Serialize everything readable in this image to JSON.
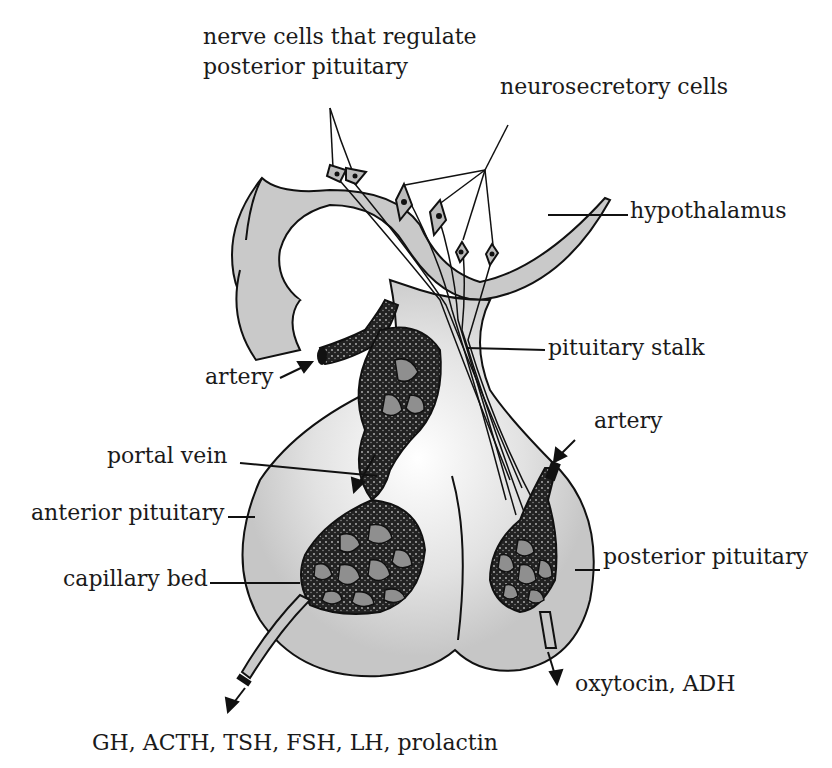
{
  "diagram": {
    "colors": {
      "tissue": "#c9c9c9",
      "tissue_light": "#ececec",
      "vessel": "#1c1c1c",
      "capillary_space": "#8f8f8f",
      "outline": "#111111",
      "text": "#1a1a1a"
    },
    "labels": {
      "nerve_cells_line1": "nerve cells that regulate",
      "nerve_cells_line2": "posterior pituitary",
      "neurosecretory_cells": "neurosecretory cells",
      "hypothalamus": "hypothalamus",
      "artery_left": "artery",
      "pituitary_stalk": "pituitary stalk",
      "artery_right": "artery",
      "portal_vein": "portal vein",
      "anterior_pituitary": "anterior pituitary",
      "capillary_bed": "capillary bed",
      "posterior_pituitary": "posterior pituitary",
      "posterior_output": "oxytocin, ADH",
      "anterior_output": "GH, ACTH, TSH, FSH, LH, prolactin"
    }
  }
}
